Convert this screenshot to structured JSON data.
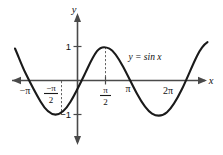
{
  "chart_data": {
    "type": "line",
    "title": "",
    "subtitle": "",
    "equation_label": "y = sin x",
    "xlabel": "x",
    "ylabel": "y",
    "xlim_radians": [
      -3.9,
      7.6
    ],
    "ylim": [
      -1.55,
      1.55
    ],
    "grid": false,
    "legend_position": "inline-right",
    "x_ticks": [
      {
        "value_radians": -3.14159,
        "label": "−π",
        "style": "plain"
      },
      {
        "value_radians": -1.5708,
        "label_numerator": "−π",
        "label_denominator": "2",
        "style": "fraction"
      },
      {
        "value_radians": 1.5708,
        "label_numerator": "π",
        "label_denominator": "2",
        "style": "fraction"
      },
      {
        "value_radians": 3.14159,
        "label": "π",
        "style": "plain"
      },
      {
        "value_radians": 6.28319,
        "label": "2π",
        "style": "plain"
      }
    ],
    "y_ticks": [
      {
        "value": 1,
        "label": "1"
      },
      {
        "value": -1,
        "label": "−1"
      }
    ],
    "series": [
      {
        "name": "y = sin x",
        "function": "sin",
        "amplitude": 1,
        "period_radians": 6.28319,
        "phase": 0,
        "color": "#1a1a1a",
        "x_start_radians": -3.76,
        "x_end_radians": 7.35,
        "key_points": [
          {
            "x_radians": -3.14159,
            "y": 0,
            "type": "zero"
          },
          {
            "x_radians": -1.5708,
            "y": -1,
            "type": "minimum"
          },
          {
            "x_radians": 0,
            "y": 0,
            "type": "zero"
          },
          {
            "x_radians": 1.5708,
            "y": 1,
            "type": "maximum"
          },
          {
            "x_radians": 3.14159,
            "y": 0,
            "type": "zero"
          },
          {
            "x_radians": 4.71239,
            "y": -1,
            "type": "minimum"
          },
          {
            "x_radians": 6.28319,
            "y": 0,
            "type": "zero"
          }
        ]
      }
    ],
    "guide_lines": [
      {
        "from_x_radians": 1.5708,
        "from_y": 1,
        "to_y": 0,
        "style": "dashed",
        "name": "peak-guide"
      },
      {
        "from_x_radians": -1.5708,
        "from_y": -1,
        "to_y": 0,
        "style": "dashed",
        "name": "trough-guide"
      }
    ],
    "axes": {
      "x_axis_arrow_left": true,
      "x_axis_arrow_right": true,
      "y_axis_arrow_up": true,
      "y_axis_arrow_down": true,
      "axis_color": "#4a4a4a"
    }
  }
}
